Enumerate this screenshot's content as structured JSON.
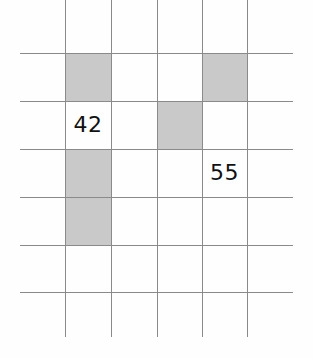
{
  "canvas": {
    "width": 313,
    "height": 358,
    "background_color": "#fefefe"
  },
  "grid": {
    "line_color": "#8a8a8a",
    "line_thickness": 1,
    "shaded_color": "#c9c9c9",
    "empty_color": "#ffffff",
    "columns": 4,
    "rows": 5,
    "cell_width": 45.5,
    "cell_height": 47.8,
    "vertical_lines_x": [
      65,
      111,
      157,
      202,
      247
    ],
    "vertical_line_top": 0,
    "vertical_line_bottom": 337,
    "horizontal_lines_y": [
      53,
      101,
      149,
      197,
      245,
      292
    ],
    "horizontal_line_left": 20,
    "horizontal_line_right": 293
  },
  "chart_data": {
    "type": "heatmap",
    "title": "",
    "xlabel": "",
    "ylabel": "",
    "columns": 4,
    "rows": 5,
    "legend": [
      {
        "name": "shaded",
        "color": "#c9c9c9"
      },
      {
        "name": "empty",
        "color": "#ffffff"
      }
    ],
    "cells": [
      {
        "col": 0,
        "row": 0,
        "state": "shaded",
        "label": ""
      },
      {
        "col": 1,
        "row": 0,
        "state": "empty",
        "label": ""
      },
      {
        "col": 2,
        "row": 0,
        "state": "empty",
        "label": ""
      },
      {
        "col": 3,
        "row": 0,
        "state": "shaded",
        "label": ""
      },
      {
        "col": 0,
        "row": 1,
        "state": "empty",
        "label": "42"
      },
      {
        "col": 1,
        "row": 1,
        "state": "empty",
        "label": ""
      },
      {
        "col": 2,
        "row": 1,
        "state": "shaded",
        "label": ""
      },
      {
        "col": 3,
        "row": 1,
        "state": "empty",
        "label": ""
      },
      {
        "col": 0,
        "row": 2,
        "state": "shaded",
        "label": ""
      },
      {
        "col": 1,
        "row": 2,
        "state": "empty",
        "label": ""
      },
      {
        "col": 2,
        "row": 2,
        "state": "empty",
        "label": ""
      },
      {
        "col": 3,
        "row": 2,
        "state": "empty",
        "label": "55"
      },
      {
        "col": 0,
        "row": 3,
        "state": "shaded",
        "label": ""
      },
      {
        "col": 1,
        "row": 3,
        "state": "empty",
        "label": ""
      },
      {
        "col": 2,
        "row": 3,
        "state": "empty",
        "label": ""
      },
      {
        "col": 3,
        "row": 3,
        "state": "empty",
        "label": ""
      },
      {
        "col": 0,
        "row": 4,
        "state": "empty",
        "label": ""
      },
      {
        "col": 1,
        "row": 4,
        "state": "empty",
        "label": ""
      },
      {
        "col": 2,
        "row": 4,
        "state": "empty",
        "label": ""
      },
      {
        "col": 3,
        "row": 4,
        "state": "empty",
        "label": ""
      }
    ],
    "shaded_cells": [
      {
        "col": 0,
        "row": 0
      },
      {
        "col": 3,
        "row": 0
      },
      {
        "col": 2,
        "row": 1
      },
      {
        "col": 0,
        "row": 2
      },
      {
        "col": 0,
        "row": 3
      }
    ],
    "labels": [
      {
        "col": 0,
        "row": 1,
        "text": "42"
      },
      {
        "col": 3,
        "row": 2,
        "text": "55"
      }
    ]
  }
}
